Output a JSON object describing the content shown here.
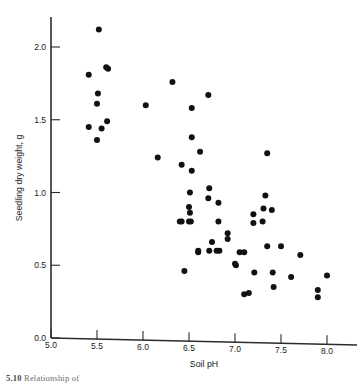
{
  "figure": {
    "background_color": "#ffffff",
    "point_color": "#111111",
    "axis_color": "#2b2b2b"
  },
  "caption": {
    "number": "5.10",
    "text": "Relationship of"
  },
  "chart_data": {
    "type": "scatter",
    "title": "",
    "xlabel": "Soil pH",
    "ylabel": "Seedling dry weight, g",
    "xlim": [
      5.0,
      8.1
    ],
    "ylim": [
      0.0,
      2.2
    ],
    "xticks": [
      5.0,
      5.5,
      6.0,
      6.5,
      7.0,
      7.5,
      8.0
    ],
    "xtick_labels": [
      "5.0",
      "5.5",
      "6.0",
      "6.5",
      "7.0",
      "7.5",
      "8.0"
    ],
    "yticks": [
      0.0,
      0.5,
      1.0,
      1.5,
      2.0
    ],
    "ytick_labels": [
      "0.0",
      "0.5",
      "1.0",
      "1.5",
      "2.0"
    ],
    "grid": false,
    "legend": null,
    "marker": "filled-circle",
    "marker_size": 3.0,
    "n_points": 62,
    "x": [
      5.52,
      5.41,
      5.62,
      5.51,
      5.5,
      5.61,
      5.41,
      5.5,
      6.03,
      6.32,
      6.16,
      6.53,
      6.42,
      6.71,
      6.53,
      6.42,
      6.62,
      6.53,
      6.71,
      6.51,
      6.5,
      6.51,
      6.5,
      6.4,
      6.52,
      6.72,
      6.82,
      6.92,
      7.2,
      6.82,
      6.92,
      6.72,
      6.75,
      6.83,
      7.01,
      7.1,
      7.33,
      7.31,
      7.3,
      7.35,
      7.2,
      7.21,
      7.4,
      7.35,
      7.1,
      7.42,
      7.41,
      7.61,
      7.71,
      8.0,
      7.9,
      7.9,
      6.6,
      6.8,
      7.0,
      7.15,
      5.6,
      5.55,
      6.45,
      6.6,
      7.05,
      7.5
    ],
    "y": [
      2.12,
      1.81,
      1.85,
      1.68,
      1.61,
      1.49,
      1.45,
      1.36,
      1.6,
      1.76,
      1.24,
      1.58,
      1.19,
      1.67,
      1.38,
      0.8,
      1.28,
      1.15,
      0.96,
      1.0,
      0.9,
      0.86,
      0.8,
      0.8,
      0.8,
      1.03,
      0.93,
      0.72,
      0.85,
      0.8,
      0.68,
      0.6,
      0.66,
      0.6,
      0.5,
      0.3,
      0.98,
      0.89,
      0.8,
      0.63,
      0.79,
      0.45,
      0.88,
      1.27,
      0.59,
      0.35,
      0.45,
      0.42,
      0.57,
      0.43,
      0.33,
      0.28,
      0.59,
      0.6,
      0.51,
      0.31,
      1.86,
      1.44,
      0.46,
      0.6,
      0.59,
      0.63
    ]
  }
}
